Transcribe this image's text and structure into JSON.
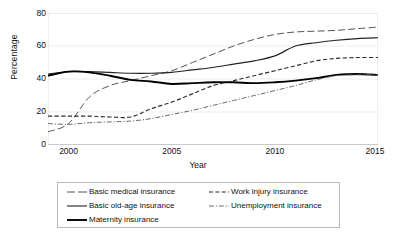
{
  "chart_data": {
    "type": "line",
    "title": "",
    "xlabel": "Year",
    "ylabel": "Percentage",
    "xlim": [
      1999,
      2015
    ],
    "ylim": [
      0,
      80
    ],
    "ytick_labels": [
      "0",
      "20",
      "40",
      "60",
      "80"
    ],
    "ytick_values": [
      0,
      20,
      40,
      60,
      80
    ],
    "xtick_labels": [
      "2000",
      "2005",
      "2010",
      "2015"
    ],
    "xtick_values": [
      2000,
      2005,
      2010,
      2015
    ],
    "grid": "horizontal",
    "legend_position": "bottom",
    "x": [
      1999,
      2000,
      2001,
      2002,
      2003,
      2004,
      2005,
      2006,
      2007,
      2008,
      2009,
      2010,
      2011,
      2012,
      2013,
      2014,
      2015
    ],
    "series": [
      {
        "name": "Basic medical insurance",
        "style": "long-dash",
        "color": "#555555",
        "values": [
          8,
          13,
          29,
          36,
          39,
          42,
          45,
          50,
          55,
          60,
          64,
          67,
          68.5,
          69,
          69.5,
          70.5,
          71.5
        ]
      },
      {
        "name": "Basic old-age insurance",
        "style": "solid-thin",
        "color": "#222222",
        "values": [
          43,
          44.5,
          44.5,
          44,
          43.5,
          43.5,
          44,
          45.5,
          47,
          49,
          51,
          54,
          60,
          62,
          63.5,
          64.5,
          65
        ]
      },
      {
        "name": "Maternity insurance",
        "style": "solid-thick",
        "color": "#000000",
        "values": [
          42,
          44.5,
          44,
          42,
          39.5,
          38.5,
          37,
          37.5,
          38,
          38,
          37.5,
          38,
          39,
          40.5,
          42.5,
          43,
          42.5
        ]
      },
      {
        "name": "Work injury insurance",
        "style": "dashed",
        "color": "#2b2b2b",
        "values": [
          17.5,
          17.5,
          17.5,
          17,
          17,
          22,
          26,
          31,
          36,
          39,
          42,
          45,
          48,
          51,
          52.5,
          53,
          53
        ]
      },
      {
        "name": "Unemployment insurance",
        "style": "dash-dot",
        "color": "#6b6b6b",
        "values": [
          13,
          12.5,
          13.5,
          14,
          14.5,
          16,
          18.5,
          21,
          24,
          27,
          30,
          33,
          36,
          39.5,
          42,
          42.5,
          42.5
        ]
      }
    ]
  },
  "legend": {
    "items": [
      {
        "label": "Basic medical insurance",
        "key": "long-dash-key",
        "col": 0,
        "row": 0
      },
      {
        "label": "Work injury insurance",
        "key": "dashed-key",
        "col": 1,
        "row": 0
      },
      {
        "label": "Basic old-age insurance",
        "key": "solid-thin-key",
        "col": 0,
        "row": 1
      },
      {
        "label": "Unemployment insurance",
        "key": "dash-dot-key",
        "col": 1,
        "row": 1
      },
      {
        "label": "Maternity insurance",
        "key": "solid-thick-key",
        "col": 0,
        "row": 2
      }
    ]
  }
}
